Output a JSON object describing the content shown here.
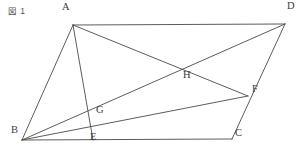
{
  "caption": {
    "text": "図 1"
  },
  "figure": {
    "width": 300,
    "height": 157,
    "background_color": "#ffffff",
    "line_color": "#4a4a4a",
    "label_color": "#3b3b3b",
    "points": [
      {
        "id": "A",
        "label": "A",
        "x": 73,
        "y": 25,
        "label_dx": -11,
        "label_dy": -13
      },
      {
        "id": "D",
        "label": "D",
        "x": 285,
        "y": 24,
        "label_dx": 2,
        "label_dy": -13
      },
      {
        "id": "B",
        "label": "B",
        "x": 22,
        "y": 140,
        "label_dx": -11,
        "label_dy": -5
      },
      {
        "id": "C",
        "label": "C",
        "x": 232,
        "y": 139,
        "label_dx": 3,
        "label_dy": -1
      },
      {
        "id": "E",
        "label": "E",
        "x": 93,
        "y": 140,
        "label_dx": -3,
        "label_dy": 2
      },
      {
        "id": "G",
        "label": "G",
        "x": 93,
        "y": 116,
        "label_dx": 3,
        "label_dy": -1
      },
      {
        "id": "H",
        "label": "H",
        "x": 185,
        "y": 78,
        "label_dx": -2,
        "label_dy": 2
      },
      {
        "id": "F",
        "label": "F",
        "x": 248,
        "y": 96,
        "label_dx": 4,
        "label_dy": -2
      }
    ],
    "segments": [
      {
        "name": "segment-AD",
        "from": "A",
        "to": "D"
      },
      {
        "name": "segment-AB",
        "from": "A",
        "to": "B"
      },
      {
        "name": "segment-BC",
        "from": "B",
        "to": "C"
      },
      {
        "name": "segment-DC",
        "from": "D",
        "to": "C"
      },
      {
        "name": "segment-AE",
        "from": "A",
        "to": "E"
      },
      {
        "name": "segment-AF",
        "from": "A",
        "to": "F"
      },
      {
        "name": "segment-BD",
        "from": "B",
        "to": "D"
      },
      {
        "name": "segment-BF",
        "from": "B",
        "to": "F"
      }
    ]
  }
}
